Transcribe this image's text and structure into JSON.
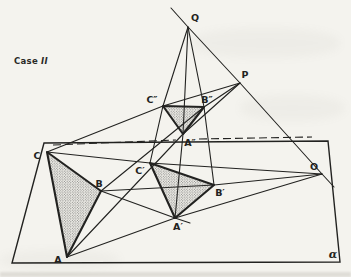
{
  "case_label": {
    "word": "Case",
    "numeral": "II"
  },
  "colors": {
    "ink": "#222220",
    "paper": "#f4f3ee",
    "stipple_dot": "#3c3c3a"
  },
  "diagram": {
    "plane": {
      "label": "α",
      "label_x": 333,
      "label_y": 254,
      "outline": [
        [
          44,
          143
        ],
        [
          328,
          141
        ],
        [
          340,
          262
        ],
        [
          12,
          263
        ]
      ]
    },
    "points": [
      {
        "id": "Q",
        "label": "Q",
        "x": 188,
        "y": 27,
        "lx": 195,
        "ly": 17
      },
      {
        "id": "P",
        "label": "P",
        "x": 240,
        "y": 83,
        "lx": 245,
        "ly": 74
      },
      {
        "id": "O",
        "label": "O",
        "x": 322,
        "y": 174,
        "lx": 314,
        "ly": 166
      },
      {
        "id": "C2",
        "label": "C″",
        "x": 163,
        "y": 106,
        "lx": 152,
        "ly": 99
      },
      {
        "id": "B2",
        "label": "B″",
        "x": 204,
        "y": 107,
        "lx": 207,
        "ly": 99
      },
      {
        "id": "A2",
        "label": "A″",
        "x": 183,
        "y": 134,
        "lx": 190,
        "ly": 142
      },
      {
        "id": "C",
        "label": "C",
        "x": 47,
        "y": 152,
        "lx": 37,
        "ly": 155
      },
      {
        "id": "B",
        "label": "B",
        "x": 101,
        "y": 191,
        "lx": 99,
        "ly": 183
      },
      {
        "id": "A",
        "label": "A",
        "x": 67,
        "y": 257,
        "lx": 58,
        "ly": 259
      },
      {
        "id": "C1",
        "label": "C′",
        "x": 150,
        "y": 163,
        "lx": 140,
        "ly": 170
      },
      {
        "id": "B1",
        "label": "B′",
        "x": 214,
        "y": 185,
        "lx": 220,
        "ly": 192
      },
      {
        "id": "A1",
        "label": "A′",
        "x": 175,
        "y": 218,
        "lx": 178,
        "ly": 226
      }
    ],
    "triangles": [
      {
        "name": "triangle-ABC",
        "pts": [
          [
            47,
            152
          ],
          [
            101,
            191
          ],
          [
            67,
            257
          ]
        ]
      },
      {
        "name": "triangle-A1B1C1",
        "pts": [
          [
            150,
            163
          ],
          [
            214,
            185
          ],
          [
            175,
            218
          ]
        ]
      },
      {
        "name": "triangle-A2B2C2",
        "pts": [
          [
            163,
            106
          ],
          [
            204,
            107
          ],
          [
            183,
            134
          ]
        ]
      }
    ],
    "lines": [
      {
        "name": "line-Q-P-O",
        "pts": [
          [
            171,
            8
          ],
          [
            188,
            27
          ],
          [
            240,
            83
          ],
          [
            322,
            174
          ],
          [
            334,
            187
          ]
        ]
      },
      {
        "name": "line-Q-C2-C1",
        "pts": [
          [
            188,
            27
          ],
          [
            163,
            106
          ],
          [
            150,
            163
          ]
        ]
      },
      {
        "name": "line-Q-A2-A1",
        "pts": [
          [
            188,
            27
          ],
          [
            183,
            134
          ],
          [
            175,
            218
          ]
        ]
      },
      {
        "name": "line-Q-B2-B1",
        "pts": [
          [
            188,
            27
          ],
          [
            204,
            107
          ],
          [
            214,
            185
          ]
        ]
      },
      {
        "name": "line-P-C2-C",
        "pts": [
          [
            240,
            83
          ],
          [
            163,
            106
          ],
          [
            47,
            152
          ]
        ]
      },
      {
        "name": "line-P-B2-B",
        "pts": [
          [
            240,
            83
          ],
          [
            204,
            107
          ],
          [
            101,
            191
          ]
        ]
      },
      {
        "name": "line-P-A2-A",
        "pts": [
          [
            240,
            83
          ],
          [
            183,
            134
          ],
          [
            67,
            257
          ]
        ]
      },
      {
        "name": "line-O-C1-C",
        "pts": [
          [
            322,
            174
          ],
          [
            150,
            163
          ],
          [
            47,
            152
          ]
        ]
      },
      {
        "name": "line-O-B1-B",
        "pts": [
          [
            322,
            174
          ],
          [
            214,
            185
          ],
          [
            101,
            191
          ]
        ]
      },
      {
        "name": "line-O-A1-A",
        "pts": [
          [
            322,
            174
          ],
          [
            175,
            218
          ],
          [
            67,
            257
          ]
        ]
      },
      {
        "name": "line-B-A1",
        "pts": [
          [
            101,
            191
          ],
          [
            175,
            218
          ],
          [
            190,
            223
          ]
        ]
      }
    ],
    "dashed_axis": [
      {
        "name": "axis-dashed-left",
        "pts": [
          [
            53,
            145
          ],
          [
            176,
            140
          ]
        ]
      },
      {
        "name": "axis-dashed-right",
        "pts": [
          [
            199,
            139
          ],
          [
            312,
            137
          ]
        ]
      }
    ]
  }
}
